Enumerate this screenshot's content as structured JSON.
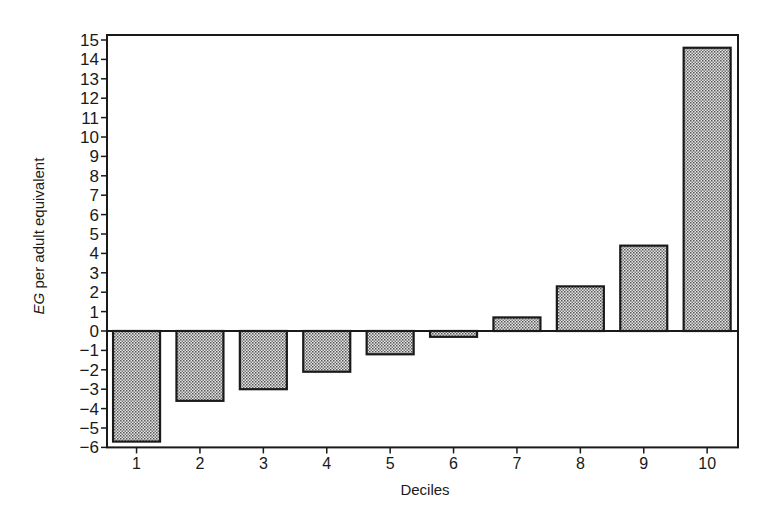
{
  "chart_data": {
    "type": "bar",
    "title": "",
    "xlabel": "Deciles",
    "ylabel": "EG per adult equivalent",
    "ylabel_italic_part": "EG",
    "ylabel_rest": " per adult equivalent",
    "categories": [
      "1",
      "2",
      "3",
      "4",
      "5",
      "6",
      "7",
      "8",
      "9",
      "10"
    ],
    "values": [
      -5.7,
      -3.6,
      -3.0,
      -2.1,
      -1.2,
      -0.3,
      0.7,
      2.3,
      4.4,
      14.6
    ],
    "ylim": [
      -6,
      15
    ],
    "yticks": [
      15,
      14,
      13,
      12,
      11,
      10,
      9,
      8,
      7,
      6,
      5,
      4,
      3,
      2,
      1,
      0,
      -1,
      -2,
      -3,
      -4,
      -5,
      -6
    ],
    "grid": false,
    "legend": null,
    "bar_fill": "stippled grey",
    "colors": {
      "bar_fill": "#b5b5b5",
      "stroke": "#1a1a1a"
    }
  }
}
